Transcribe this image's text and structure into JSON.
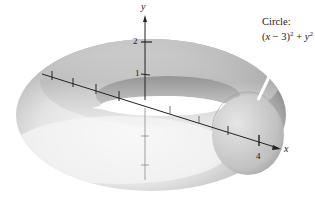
{
  "figure": {
    "type": "torus-surface-of-revolution",
    "annotation": {
      "title": "Circle:",
      "equation_parts": {
        "open": "(",
        "x": "x",
        "minus_three": " − 3)",
        "exp1": "2",
        "plus": " + ",
        "y": "y",
        "exp2": "2",
        "equals": " = 1"
      }
    },
    "axes": {
      "x_label": "x",
      "y_label": "y",
      "y_ticks": [
        {
          "label": "2",
          "value": 2
        },
        {
          "label": "1",
          "value": 1
        }
      ],
      "x_ticks": [
        {
          "label": "4",
          "value": 4
        }
      ]
    },
    "colors": {
      "surface_light": "#f4f4f4",
      "surface_mid": "#c8c8c8",
      "surface_dark": "#8a8a8a",
      "axis": "#222222",
      "background": "#ffffff"
    }
  }
}
